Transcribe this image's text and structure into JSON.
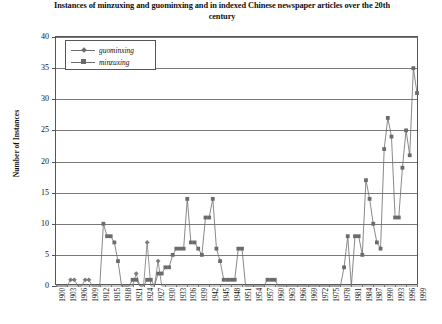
{
  "chart_data": {
    "type": "line",
    "title": "Instances of minzuxing and guominxing and in indexed Chinese newspaper articles over the 20th century",
    "xlabel": "",
    "ylabel": "Number of Instances",
    "ylim": [
      0,
      40
    ],
    "ytick_step": 5,
    "yticks": [
      0,
      5,
      10,
      15,
      20,
      25,
      30,
      35,
      40
    ],
    "xlim": [
      1900,
      1999
    ],
    "xticks": [
      1900,
      1903,
      1906,
      1909,
      1912,
      1915,
      1918,
      1921,
      1924,
      1927,
      1930,
      1933,
      1936,
      1939,
      1942,
      1945,
      1948,
      1951,
      1954,
      1957,
      1960,
      1963,
      1966,
      1969,
      1972,
      1975,
      1978,
      1981,
      1984,
      1987,
      1990,
      1993,
      1996,
      1999
    ],
    "grid": "horizontal",
    "legend_position": "top-left-inside",
    "markers": {
      "guominxing": "diamond",
      "minzuxing": "square"
    },
    "colors": {
      "guominxing": "#7a7a7a",
      "minzuxing": "#6b6b6b",
      "gridline": "#7a7a7a",
      "axis": "#555555"
    },
    "x": [
      1900,
      1901,
      1902,
      1903,
      1904,
      1905,
      1906,
      1907,
      1908,
      1909,
      1910,
      1911,
      1912,
      1913,
      1914,
      1915,
      1916,
      1917,
      1918,
      1919,
      1920,
      1921,
      1922,
      1923,
      1924,
      1925,
      1926,
      1927,
      1928,
      1929,
      1930,
      1931,
      1932,
      1933,
      1934,
      1935,
      1936,
      1937,
      1938,
      1939,
      1940,
      1941,
      1942,
      1943,
      1944,
      1945,
      1946,
      1947,
      1948,
      1949,
      1950,
      1951,
      1952,
      1953,
      1954,
      1955,
      1956,
      1957,
      1958,
      1959,
      1960,
      1961,
      1962,
      1963,
      1964,
      1965,
      1966,
      1967,
      1968,
      1969,
      1970,
      1971,
      1972,
      1973,
      1974,
      1975,
      1976,
      1977,
      1978,
      1979,
      1980,
      1981,
      1982,
      1983,
      1984,
      1985,
      1986,
      1987,
      1988,
      1989,
      1990,
      1991,
      1992,
      1993,
      1994,
      1995,
      1996,
      1997,
      1998,
      1999
    ],
    "series": [
      {
        "name": "guominxing",
        "marker": "diamond",
        "values": [
          0,
          0,
          0,
          0,
          1,
          1,
          0,
          0,
          1,
          1,
          0,
          0,
          0,
          0,
          0,
          0,
          0,
          0,
          0,
          0,
          0,
          0,
          2,
          0,
          0,
          7,
          0,
          0,
          4,
          0,
          0,
          0,
          0,
          0,
          0,
          0,
          0,
          0,
          0,
          0,
          0,
          0,
          0,
          0,
          0,
          0,
          0,
          0,
          0,
          0,
          0,
          0,
          0,
          0,
          0,
          0,
          0,
          0,
          0,
          0,
          0,
          0,
          0,
          0,
          0,
          0,
          0,
          0,
          0,
          0,
          0,
          0,
          0,
          0,
          0,
          0,
          0,
          0,
          0,
          0,
          0,
          0,
          0,
          0,
          0,
          0,
          0,
          0,
          0,
          0,
          0,
          0,
          0,
          0,
          0,
          0,
          0,
          0,
          0,
          0
        ]
      },
      {
        "name": "minzuxing",
        "marker": "square",
        "values": [
          0,
          0,
          0,
          0,
          0,
          0,
          0,
          0,
          0,
          0,
          0,
          0,
          0,
          10,
          8,
          8,
          7,
          4,
          0,
          0,
          0,
          1,
          1,
          0,
          0,
          1,
          1,
          0,
          2,
          2,
          3,
          3,
          5,
          6,
          6,
          6,
          14,
          7,
          7,
          6,
          5,
          11,
          11,
          14,
          6,
          4,
          1,
          1,
          1,
          1,
          6,
          6,
          0,
          0,
          0,
          0,
          0,
          0,
          1,
          1,
          1,
          0,
          0,
          0,
          0,
          0,
          0,
          0,
          0,
          0,
          0,
          0,
          0,
          0,
          0,
          0,
          0,
          0,
          0,
          3,
          8,
          0,
          8,
          8,
          5,
          17,
          14,
          10,
          7,
          6,
          22,
          27,
          24,
          11,
          11,
          19,
          25,
          21,
          35,
          31
        ]
      }
    ]
  },
  "legend": {
    "items": [
      {
        "label": "guominxing"
      },
      {
        "label": "minzuxing"
      }
    ]
  }
}
